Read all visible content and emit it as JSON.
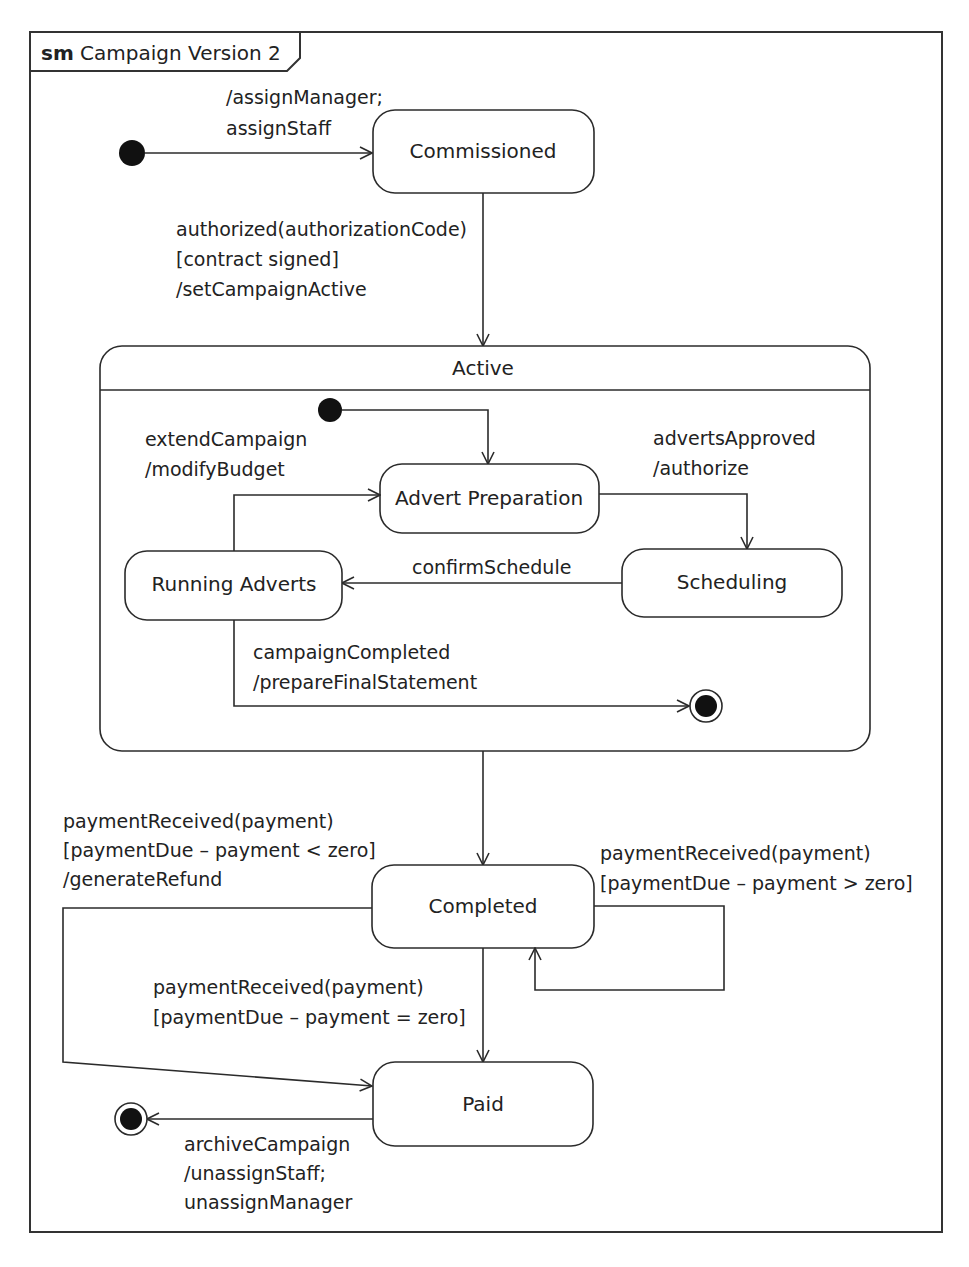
{
  "frame": {
    "keyword": "sm",
    "title": "Campaign Version 2"
  },
  "states": {
    "commissioned": "Commissioned",
    "active": "Active",
    "advert_preparation": "Advert Preparation",
    "scheduling": "Scheduling",
    "running_adverts": "Running Adverts",
    "completed": "Completed",
    "paid": "Paid"
  },
  "transitions": {
    "initial_to_commissioned": [
      "/assignManager;",
      "assignStaff"
    ],
    "commissioned_to_active": [
      "authorized(authorizationCode)",
      "[contract signed]",
      "/setCampaignActive"
    ],
    "running_to_advert_prep": [
      "extendCampaign",
      "/modifyBudget"
    ],
    "advert_prep_to_scheduling": [
      "advertsApproved",
      "/authorize"
    ],
    "scheduling_to_running": [
      "confirmSchedule"
    ],
    "running_to_final": [
      "campaignCompleted",
      "/prepareFinalStatement"
    ],
    "completed_to_paid_refund": [
      "paymentReceived(payment)",
      "[paymentDue – payment < zero]",
      "/generateRefund"
    ],
    "completed_self": [
      "paymentReceived(payment)",
      "[paymentDue – payment > zero]"
    ],
    "completed_to_paid": [
      "paymentReceived(payment)",
      "[paymentDue – payment = zero]"
    ],
    "paid_to_final": [
      "archiveCampaign",
      "/unassignStaff;",
      "unassignManager"
    ]
  },
  "icons": {
    "initial": "initial-pseudostate",
    "final": "final-state"
  }
}
